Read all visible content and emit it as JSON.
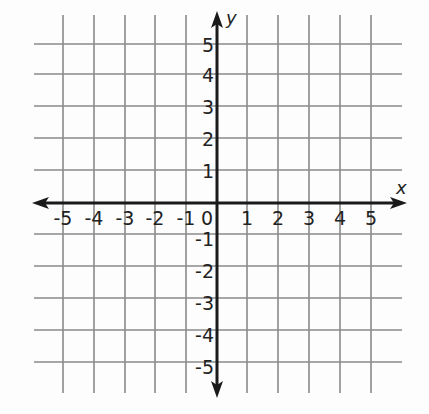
{
  "diagram": {
    "type": "coordinate-plane",
    "x_axis": {
      "label": "x",
      "min": -5,
      "max": 5,
      "tick_labels": [
        "-5",
        "-4",
        "-3",
        "-2",
        "-1",
        "0",
        "1",
        "2",
        "3",
        "4",
        "5"
      ]
    },
    "y_axis": {
      "label": "y",
      "min": -5,
      "max": 5,
      "tick_labels_positive": [
        "1",
        "2",
        "3",
        "4",
        "5"
      ],
      "tick_labels_negative": [
        "-1",
        "-2",
        "-3",
        "-4",
        "-5"
      ]
    },
    "grid": true,
    "colors": {
      "grid": "#8a8a8a",
      "axis": "#1a1a1a",
      "background": "#fdfdfd"
    }
  },
  "layout": {
    "vlines_x": [
      63,
      94,
      125,
      155,
      186,
      247,
      278,
      309,
      340,
      371
    ],
    "hlines_y": [
      44,
      74,
      106,
      138,
      170,
      234,
      266,
      298,
      330,
      362
    ],
    "grid_top": 15,
    "grid_bottom": 393,
    "grid_left": 34,
    "grid_right": 402,
    "origin_x": 217,
    "origin_y": 203,
    "x_arrow_left": 32,
    "x_arrow_right": 407,
    "y_arrow_top": 11,
    "y_arrow_bottom": 398
  }
}
